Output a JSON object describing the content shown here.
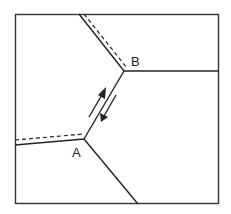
{
  "diagram": {
    "type": "grain-boundary-sliding",
    "labels": {
      "point_a": "A",
      "point_b": "B"
    },
    "points": {
      "A": [
        84,
        139
      ],
      "B": [
        124,
        71
      ]
    },
    "colors": {
      "line": "#222222",
      "background": "#ffffff"
    }
  }
}
